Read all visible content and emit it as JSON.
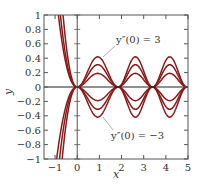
{
  "chart_data": {
    "type": "line",
    "title": "",
    "xlabel": "x",
    "ylabel": "y",
    "xlim": [
      -1.5,
      5
    ],
    "ylim": [
      -1,
      1
    ],
    "grid": false,
    "xticks": [
      -1,
      0,
      1,
      2,
      3,
      4,
      5
    ],
    "xtick_labels": [
      "−1",
      "0",
      "1",
      "2",
      "3",
      "4",
      "5"
    ],
    "yticks": [
      -1,
      -0.8,
      -0.6,
      -0.4,
      -0.2,
      0,
      0.2,
      0.4,
      0.6,
      0.8,
      1
    ],
    "ytick_labels": [
      "−1",
      "−0.8",
      "−0.6",
      "−0.4",
      "−0.2",
      "0",
      "0.2",
      "0.4",
      "0.6",
      "0.8",
      "1"
    ],
    "zero_crossings_x": [
      0,
      1.85,
      3.4,
      4.95
    ],
    "series": [
      {
        "name": "y''(0) = 3",
        "arch_peak": 0.42,
        "left_cross_top_x": -0.85
      },
      {
        "name": "y''(0) = 2",
        "arch_peak": 0.31,
        "left_cross_top_x": -0.76
      },
      {
        "name": "y''(0) = 1",
        "arch_peak": 0.19,
        "left_cross_top_x": -0.64
      },
      {
        "name": "y''(0) = -1",
        "arch_peak": -0.19,
        "left_cross_top_x": -0.68
      },
      {
        "name": "y''(0) = -2",
        "arch_peak": -0.31,
        "left_cross_top_x": -0.8
      },
      {
        "name": "y''(0) = -3",
        "arch_peak": -0.42,
        "left_cross_top_x": -0.93
      }
    ],
    "annotations": [
      {
        "text": "y″(0) = 3",
        "x": 1.75,
        "y": 0.6
      },
      {
        "text": "y″(0) = −3",
        "x": 1.55,
        "y": -0.7
      }
    ],
    "line_color": "#8b1a1a"
  }
}
